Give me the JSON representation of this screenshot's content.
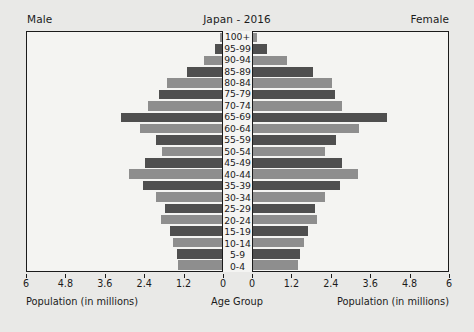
{
  "header": {
    "title": "Japan - 2016",
    "male_label": "Male",
    "female_label": "Female"
  },
  "axis_titles": {
    "male": "Population (in millions)",
    "female": "Population (in millions)",
    "center": "Age Group"
  },
  "colors": {
    "page_background": "#e9e9e7",
    "plot_background": "#f4f4f2",
    "frame": "#1b1b1b",
    "bar_light": "#8e8e8e",
    "bar_dark": "#4f4f4f"
  },
  "chart_data": {
    "type": "bar",
    "subtype": "population-pyramid",
    "title": "Japan - 2016",
    "xlabel": "Population (in millions)",
    "ylabel": "Age Group",
    "grid": false,
    "legend": "none",
    "xlim": [
      0,
      6
    ],
    "male_axis_ticks": [
      "6",
      "4.8",
      "3.6",
      "2.4",
      "1.2",
      "0"
    ],
    "female_axis_ticks": [
      "0",
      "1.2",
      "2.4",
      "3.6",
      "4.8",
      "6"
    ],
    "categories": [
      "100+",
      "95-99",
      "90-94",
      "85-89",
      "80-84",
      "75-79",
      "70-74",
      "65-69",
      "60-64",
      "55-59",
      "50-54",
      "45-49",
      "40-44",
      "35-39",
      "30-34",
      "25-29",
      "20-24",
      "15-19",
      "10-14",
      "5-9",
      "0-4"
    ],
    "series": [
      {
        "name": "Male",
        "side": "left",
        "values": [
          0.07,
          0.22,
          0.56,
          1.09,
          1.68,
          1.95,
          2.28,
          3.12,
          2.53,
          2.02,
          1.86,
          2.36,
          2.85,
          2.42,
          2.02,
          1.75,
          1.88,
          1.61,
          1.51,
          1.39,
          1.34
        ]
      },
      {
        "name": "Female",
        "side": "right",
        "values": [
          0.12,
          0.44,
          1.05,
          1.84,
          2.42,
          2.52,
          2.74,
          4.11,
          3.25,
          2.54,
          2.23,
          2.74,
          3.22,
          2.69,
          2.23,
          1.91,
          1.98,
          1.68,
          1.57,
          1.44,
          1.38
        ]
      }
    ]
  }
}
